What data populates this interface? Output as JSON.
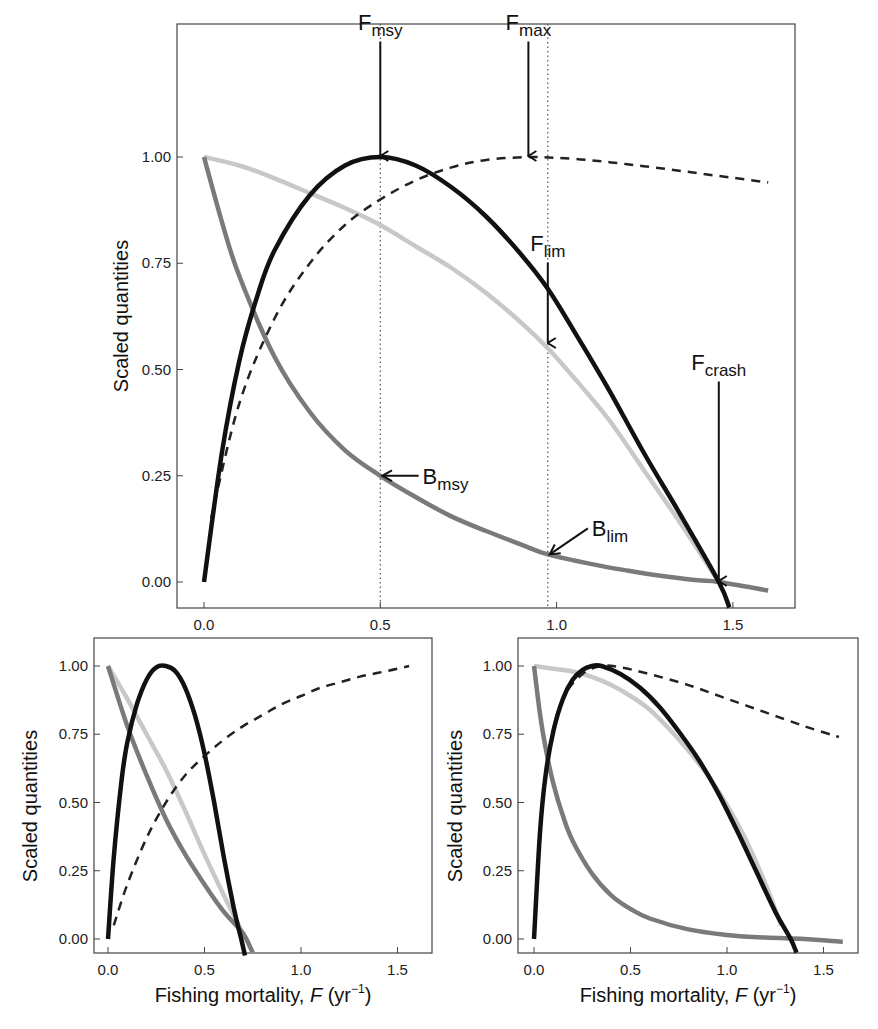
{
  "chart_data": [
    {
      "type": "line",
      "panel": "top",
      "title": "",
      "xlabel": "",
      "ylabel": "Scaled quantities",
      "xlim": [
        -0.08,
        1.68
      ],
      "ylim": [
        -0.07,
        1.36
      ],
      "xticks": [
        0.0,
        0.5,
        1.0,
        1.5
      ],
      "xtick_labels": [
        "0.0",
        "0.5",
        "1.0",
        "1.5"
      ],
      "yticks": [
        0.0,
        0.25,
        0.5,
        0.75,
        1.0
      ],
      "ytick_labels": [
        "0.00",
        "0.25",
        "0.50",
        "0.75",
        "1.00"
      ],
      "grid": false,
      "vlines": [
        0.5,
        0.975
      ],
      "series": [
        {
          "name": "Yield",
          "style": "solid",
          "color": "#111111",
          "width": 4.5,
          "x": [
            0,
            0.05,
            0.1,
            0.15,
            0.2,
            0.3,
            0.4,
            0.5,
            0.6,
            0.7,
            0.8,
            0.9,
            0.975,
            1.05,
            1.15,
            1.25,
            1.35,
            1.46,
            1.49
          ],
          "y": [
            0,
            0.3,
            0.52,
            0.67,
            0.78,
            0.91,
            0.98,
            1.0,
            0.98,
            0.93,
            0.86,
            0.77,
            0.69,
            0.59,
            0.45,
            0.3,
            0.16,
            0.0,
            -0.06
          ]
        },
        {
          "name": "Yield per recruit",
          "style": "dashed",
          "color": "#222222",
          "width": 2.5,
          "x": [
            0.02,
            0.1,
            0.2,
            0.3,
            0.4,
            0.5,
            0.6,
            0.7,
            0.8,
            0.92,
            1.0,
            1.1,
            1.2,
            1.3,
            1.4,
            1.5,
            1.6
          ],
          "y": [
            0.15,
            0.42,
            0.62,
            0.75,
            0.84,
            0.9,
            0.945,
            0.975,
            0.993,
            1.0,
            0.998,
            0.992,
            0.983,
            0.973,
            0.962,
            0.951,
            0.94
          ]
        },
        {
          "name": "Biomass",
          "style": "solid",
          "color": "#7a7a7a",
          "width": 4.5,
          "x": [
            0,
            0.05,
            0.1,
            0.2,
            0.3,
            0.4,
            0.5,
            0.6,
            0.7,
            0.8,
            0.9,
            0.975,
            1.1,
            1.2,
            1.3,
            1.4,
            1.46,
            1.6
          ],
          "y": [
            1.0,
            0.85,
            0.72,
            0.53,
            0.4,
            0.31,
            0.25,
            0.2,
            0.155,
            0.12,
            0.088,
            0.065,
            0.042,
            0.027,
            0.014,
            0.004,
            0.0,
            -0.02
          ]
        },
        {
          "name": "Spawning potential ratio",
          "style": "solid",
          "color": "#c8c8c8",
          "width": 4.5,
          "x": [
            0,
            0.1,
            0.2,
            0.3,
            0.4,
            0.5,
            0.6,
            0.7,
            0.8,
            0.9,
            0.975,
            1.05,
            1.15,
            1.25,
            1.35,
            1.46
          ],
          "y": [
            1.0,
            0.98,
            0.95,
            0.915,
            0.88,
            0.84,
            0.79,
            0.74,
            0.68,
            0.61,
            0.55,
            0.48,
            0.38,
            0.26,
            0.14,
            0.0
          ]
        }
      ],
      "annotations": [
        {
          "text": "F",
          "sub": "msy",
          "x": 0.5,
          "y_label": 1.3,
          "arrow_to": 1.0
        },
        {
          "text": "F",
          "sub": "max",
          "x": 0.92,
          "y_label": 1.3,
          "arrow_to": 1.0
        },
        {
          "text": "F",
          "sub": "lim",
          "x": 0.975,
          "y_label": 0.78,
          "arrow_to": 0.56
        },
        {
          "text": "F",
          "sub": "crash",
          "x": 1.46,
          "y_label": 0.5,
          "arrow_to": 0.0
        },
        {
          "text": "B",
          "sub": "msy",
          "x": 0.5,
          "y": 0.25,
          "label_x": 0.62
        },
        {
          "text": "B",
          "sub": "lim",
          "x": 0.975,
          "y": 0.065,
          "label_x": 1.1
        }
      ]
    },
    {
      "type": "line",
      "panel": "bottom-left",
      "xlabel": "Fishing mortality, F (yr⁻¹)",
      "ylabel": "Scaled quantities",
      "xlim": [
        -0.07,
        1.68
      ],
      "ylim": [
        -0.05,
        1.1
      ],
      "xticks": [
        0.0,
        0.5,
        1.0,
        1.5
      ],
      "xtick_labels": [
        "0.0",
        "0.5",
        "1.0",
        "1.5"
      ],
      "yticks": [
        0.0,
        0.25,
        0.5,
        0.75,
        1.0
      ],
      "ytick_labels": [
        "0.00",
        "0.25",
        "0.50",
        "0.75",
        "1.00"
      ],
      "grid": false,
      "series": [
        {
          "name": "Yield",
          "style": "solid",
          "color": "#111111",
          "width": 4.5,
          "x": [
            0,
            0.03,
            0.07,
            0.1,
            0.15,
            0.2,
            0.25,
            0.3,
            0.35,
            0.4,
            0.45,
            0.5,
            0.55,
            0.6,
            0.65,
            0.69,
            0.71
          ],
          "y": [
            0,
            0.3,
            0.58,
            0.72,
            0.86,
            0.95,
            0.995,
            1.0,
            0.98,
            0.92,
            0.82,
            0.68,
            0.5,
            0.3,
            0.12,
            0.0,
            -0.06
          ]
        },
        {
          "name": "Yield per recruit",
          "style": "dashed",
          "color": "#222222",
          "width": 2.5,
          "x": [
            0.03,
            0.1,
            0.2,
            0.3,
            0.4,
            0.5,
            0.6,
            0.7,
            0.8,
            0.9,
            1.0,
            1.1,
            1.2,
            1.3,
            1.4,
            1.5,
            1.56
          ],
          "y": [
            0.05,
            0.2,
            0.37,
            0.5,
            0.6,
            0.67,
            0.73,
            0.78,
            0.82,
            0.86,
            0.89,
            0.92,
            0.94,
            0.96,
            0.975,
            0.99,
            1.0
          ]
        },
        {
          "name": "Biomass",
          "style": "solid",
          "color": "#7a7a7a",
          "width": 4.5,
          "x": [
            0,
            0.1,
            0.2,
            0.3,
            0.4,
            0.5,
            0.6,
            0.7,
            0.75
          ],
          "y": [
            1.0,
            0.78,
            0.6,
            0.44,
            0.31,
            0.2,
            0.1,
            0.02,
            -0.05
          ]
        },
        {
          "name": "Spawning potential ratio",
          "style": "solid",
          "color": "#c8c8c8",
          "width": 4.5,
          "x": [
            0,
            0.1,
            0.2,
            0.3,
            0.4,
            0.5,
            0.6,
            0.7,
            0.75
          ],
          "y": [
            1.0,
            0.88,
            0.75,
            0.62,
            0.47,
            0.31,
            0.16,
            0.02,
            -0.05
          ]
        }
      ]
    },
    {
      "type": "line",
      "panel": "bottom-right",
      "xlabel": "Fishing mortality, F (yr⁻¹)",
      "ylabel": "Scaled quantities",
      "xlim": [
        -0.07,
        1.68
      ],
      "ylim": [
        -0.05,
        1.1
      ],
      "xticks": [
        0.0,
        0.5,
        1.0,
        1.5
      ],
      "xtick_labels": [
        "0.0",
        "0.5",
        "1.0",
        "1.5"
      ],
      "yticks": [
        0.0,
        0.25,
        0.5,
        0.75,
        1.0
      ],
      "ytick_labels": [
        "0.00",
        "0.25",
        "0.50",
        "0.75",
        "1.00"
      ],
      "grid": false,
      "series": [
        {
          "name": "Yield",
          "style": "solid",
          "color": "#111111",
          "width": 4.5,
          "x": [
            0,
            0.03,
            0.06,
            0.1,
            0.15,
            0.2,
            0.25,
            0.3,
            0.35,
            0.45,
            0.55,
            0.65,
            0.75,
            0.85,
            0.95,
            1.05,
            1.15,
            1.25,
            1.33,
            1.36
          ],
          "y": [
            0,
            0.38,
            0.6,
            0.76,
            0.88,
            0.95,
            0.985,
            1.0,
            1.0,
            0.97,
            0.92,
            0.85,
            0.76,
            0.66,
            0.54,
            0.4,
            0.25,
            0.1,
            0.0,
            -0.05
          ]
        },
        {
          "name": "Yield per recruit",
          "style": "dashed",
          "color": "#222222",
          "width": 2.5,
          "x": [
            0.03,
            0.08,
            0.15,
            0.25,
            0.35,
            0.45,
            0.6,
            0.8,
            1.0,
            1.2,
            1.4,
            1.58
          ],
          "y": [
            0.4,
            0.7,
            0.88,
            0.97,
            1.0,
            0.995,
            0.97,
            0.93,
            0.88,
            0.83,
            0.78,
            0.74
          ]
        },
        {
          "name": "Biomass",
          "style": "solid",
          "color": "#7a7a7a",
          "width": 4.5,
          "x": [
            0,
            0.03,
            0.06,
            0.1,
            0.15,
            0.2,
            0.3,
            0.4,
            0.5,
            0.6,
            0.8,
            1.0,
            1.2,
            1.4,
            1.6
          ],
          "y": [
            1.0,
            0.83,
            0.7,
            0.57,
            0.45,
            0.36,
            0.24,
            0.16,
            0.11,
            0.075,
            0.035,
            0.015,
            0.005,
            0.0,
            -0.01
          ]
        },
        {
          "name": "Spawning potential ratio",
          "style": "solid",
          "color": "#c8c8c8",
          "width": 4.5,
          "x": [
            0,
            0.1,
            0.2,
            0.3,
            0.4,
            0.5,
            0.6,
            0.7,
            0.8,
            0.9,
            1.0,
            1.1,
            1.2,
            1.28
          ],
          "y": [
            1.0,
            0.99,
            0.98,
            0.96,
            0.93,
            0.89,
            0.84,
            0.77,
            0.69,
            0.6,
            0.49,
            0.36,
            0.2,
            0.05
          ]
        }
      ]
    }
  ],
  "labels": {
    "ylabel": "Scaled quantities",
    "xlabel_main": "Fishing mortality, ",
    "xlabel_var": "F",
    "xlabel_unit_open": " (yr",
    "xlabel_exp": "−1",
    "xlabel_unit_close": ")"
  }
}
